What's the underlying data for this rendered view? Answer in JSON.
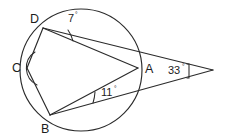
{
  "figure": {
    "stroke_color": "#2b2b2b",
    "background_color": "#ffffff",
    "label_color": "#1c1c1c"
  },
  "circle": {
    "name": "circle-outline",
    "cx": 81,
    "cy": 70,
    "r": 61
  },
  "points": {
    "D": {
      "label": "D",
      "x": 43,
      "y": 28,
      "label_x": 30,
      "label_y": 23
    },
    "C": {
      "label": "C",
      "x": 27,
      "y": 68,
      "label_x": 12,
      "label_y": 72
    },
    "B": {
      "label": "B",
      "x": 50,
      "y": 115,
      "label_x": 41,
      "label_y": 133
    },
    "A": {
      "label": "A",
      "x": 138,
      "y": 68,
      "label_x": 145,
      "label_y": 73
    },
    "E": {
      "label": "",
      "x": 213,
      "y": 70,
      "label_x": 213,
      "label_y": 70
    }
  },
  "segments": [
    {
      "name": "segment-d-to-e",
      "from": "D",
      "to": "E"
    },
    {
      "name": "segment-d-to-a",
      "from": "D",
      "to": "A"
    },
    {
      "name": "segment-b-to-a",
      "from": "B",
      "to": "A"
    },
    {
      "name": "segment-b-to-e",
      "from": "B",
      "to": "E"
    },
    {
      "name": "chord-d-to-c",
      "from": "D",
      "to": "C"
    },
    {
      "name": "chord-c-to-b",
      "from": "C",
      "to": "B"
    }
  ],
  "angles": [
    {
      "name": "angle-at-d",
      "vertex": "D",
      "value": "7",
      "degree_symbol": "°",
      "label_x": 68,
      "label_y": 22
    },
    {
      "name": "angle-at-b",
      "vertex": "B",
      "value": "11",
      "degree_symbol": "°",
      "label_x": 101,
      "label_y": 96
    },
    {
      "name": "angle-at-e",
      "vertex": "E",
      "value": "33",
      "degree_symbol": "°",
      "label_x": 168,
      "label_y": 74
    },
    {
      "name": "angle-at-c",
      "vertex": "C",
      "value": "",
      "degree_symbol": "",
      "label_x": 0,
      "label_y": 0
    }
  ]
}
